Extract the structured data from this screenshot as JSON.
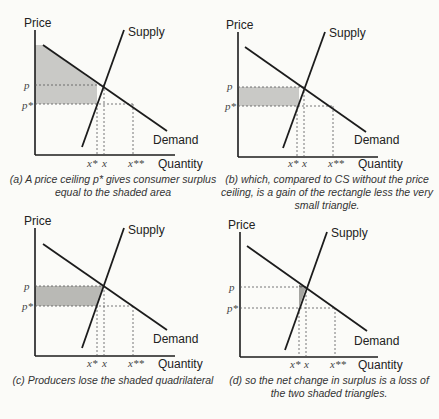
{
  "labels": {
    "price": "Price",
    "quantity": "Quantity",
    "supply": "Supply",
    "demand": "Demand",
    "p": "p",
    "p_star": "p*",
    "x_star": "x*",
    "x": "x",
    "x_double_star": "x**"
  },
  "captions": {
    "a": "(a) A price ceiling p* gives consumer surplus equal to the shaded area",
    "b": "(b) which, compared to CS without the price ceiling, is a gain of the rectangle less the very small triangle.",
    "c": "(c) Producers lose the shaded quadrilateral",
    "d": "(d) so the net change in surplus is a loss of the two shaded triangles."
  },
  "colors": {
    "line": "#1c1c1c",
    "shade": "#c9c9c6",
    "dashed": "#555555",
    "background": "#fbfbf8"
  },
  "panels": [
    {
      "id": "a",
      "shading": "consumer surplus under ceiling (area below demand down to p*, left of x*)"
    },
    {
      "id": "b",
      "shading": "rectangle between p and p*, left of x*; small triangle near equilibrium"
    },
    {
      "id": "c",
      "shading": "quadrilateral between p and p*, left of supply"
    },
    {
      "id": "d",
      "shading": "two small triangles near equilibrium between x* and x"
    }
  ]
}
